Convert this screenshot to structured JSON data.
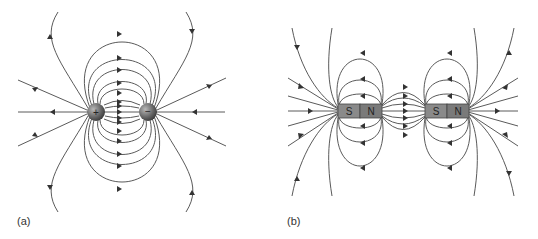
{
  "panels": [
    {
      "id": "a",
      "label": "(a)",
      "description": "Electric field lines of a dipole",
      "charges": [
        {
          "sign": "+",
          "cx": 96,
          "cy": 112
        },
        {
          "sign": "−",
          "cx": 148,
          "cy": 112
        }
      ]
    },
    {
      "id": "b",
      "label": "(b)",
      "description": "Magnetic field lines of two bar magnets",
      "magnets": [
        {
          "south": "S",
          "north": "N"
        },
        {
          "south": "S",
          "north": "N"
        }
      ]
    }
  ],
  "colors": {
    "line": "#5a5a5a",
    "charge": "#6a6a6a",
    "magnet_s": "#8a8a8a",
    "magnet_n": "#7a7a7a"
  }
}
